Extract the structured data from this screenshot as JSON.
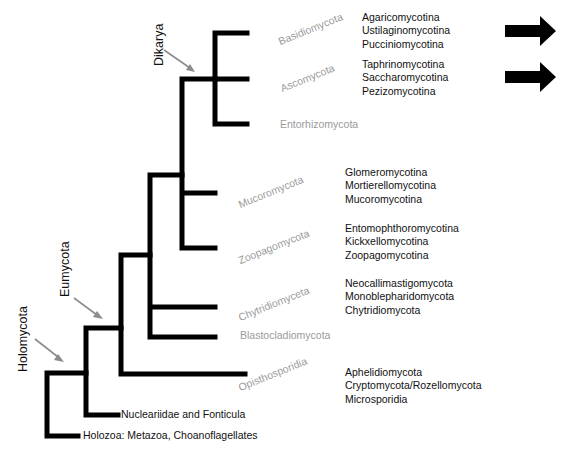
{
  "diagram": {
    "type": "phylogenetic-tree",
    "clades": {
      "dikarya": "Dikarya",
      "eumycota": "Eumycota",
      "holomycota": "Holomycota"
    },
    "phyla": {
      "basidiomycota": "Basidiomycota",
      "ascomycota": "Ascomycota",
      "entorhizomycota": "Entorhizomycota",
      "mucoromycota": "Mucoromycota",
      "zoopagomycota": "Zoopagomycota",
      "chytridiomyceta": "Chytridiomyceta",
      "blastocladiomycota": "Blastocladiomycota",
      "opisthosporidia": "Opisthosporidia"
    },
    "subgroups": {
      "basidiomycota": [
        "Agaricomycotina",
        "Ustilaginomycotina",
        "Pucciniomycotina"
      ],
      "ascomycota": [
        "Taphrinomycotina",
        "Saccharomycotina",
        "Pezizomycotina"
      ],
      "mucoromycota": [
        "Glomeromycotina",
        "Mortierellomycotina",
        "Mucoromycotina"
      ],
      "zoopagomycota": [
        "Entomophthoromycotina",
        "Kickxellomycotina",
        "Zoopagomycotina"
      ],
      "chytridiomyceta": [
        "Neocallimastigomycota",
        "Monoblepharidomycota",
        "Chytridiomycota"
      ],
      "opisthosporidia": [
        "Aphelidiomycota",
        "Cryptomycota/Rozellomycota",
        "Microsporidia"
      ]
    },
    "outgroups": {
      "nucleariidae": "Nucleariidae and Fonticula",
      "holozoa": "Holozoa: Metazoa, Choanoflagellates"
    },
    "arrows": {
      "right_arrow_count": 2,
      "right_arrow_targets": [
        "basidiomycota",
        "ascomycota"
      ],
      "pointer_arrow_color": "#8c8c8c"
    },
    "colors": {
      "branch": "#000000",
      "phylum_text": "#9a9a9a",
      "text": "#111111"
    }
  }
}
